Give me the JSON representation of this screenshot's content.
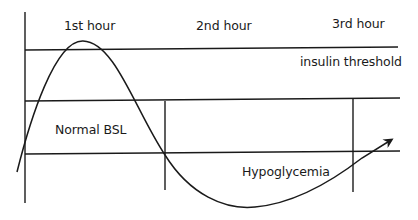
{
  "diagram": {
    "type": "blood-sugar-curve",
    "colors": {
      "line": "#1a1a1a",
      "background": "#ffffff"
    },
    "time_labels": [
      {
        "id": "hour-1",
        "text": "1st hour"
      },
      {
        "id": "hour-2",
        "text": "2nd hour"
      },
      {
        "id": "hour-3",
        "text": "3rd hour"
      }
    ],
    "zones": {
      "insulin_threshold": "insulin threshold",
      "normal": "Normal BSL",
      "hypoglycemia": "Hypoglycemia"
    }
  }
}
